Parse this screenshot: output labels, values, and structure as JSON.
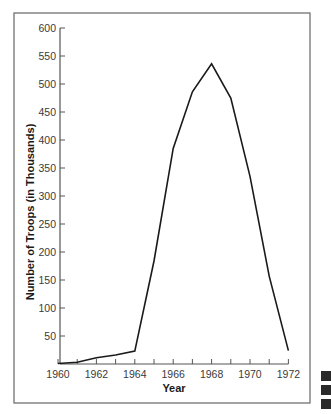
{
  "chart_data": {
    "type": "line",
    "title": "",
    "xlabel": "Year",
    "ylabel": "Number of Troops (in Thousands)",
    "x": [
      1960,
      1961,
      1962,
      1963,
      1964,
      1965,
      1966,
      1967,
      1968,
      1969,
      1970,
      1971,
      1972
    ],
    "series": [
      {
        "name": "Number of Troops (in Thousands)",
        "values": [
          0.9,
          3,
          11,
          16,
          23,
          184,
          385,
          486,
          536,
          475,
          335,
          157,
          24
        ]
      }
    ],
    "xlim": [
      1960,
      1972
    ],
    "ylim": [
      0,
      600
    ],
    "x_ticks": [
      1960,
      1961,
      1962,
      1963,
      1964,
      1965,
      1966,
      1967,
      1968,
      1969,
      1970,
      1971,
      1972
    ],
    "x_tick_labels": [
      "1960",
      "1962",
      "1964",
      "1966",
      "1968",
      "1970",
      "1972"
    ],
    "y_tick_labels": [
      "50",
      "100",
      "150",
      "200",
      "250",
      "300",
      "350",
      "400",
      "450",
      "500",
      "550",
      "600"
    ],
    "grid": false,
    "legend": null,
    "line_color": "#1a1a1a",
    "frame_color": "#555555"
  }
}
